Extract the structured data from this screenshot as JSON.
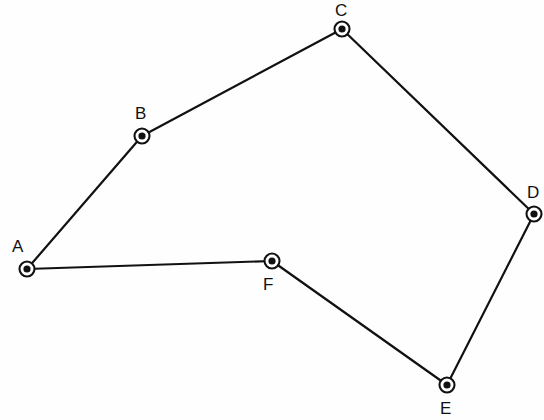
{
  "diagram": {
    "type": "node-link-polygon",
    "canvas": {
      "width": 544,
      "height": 420
    },
    "colors": {
      "background": "#fefefe",
      "stroke": "#111111",
      "node_fill": "#ffffff",
      "node_dot": "#111111",
      "label": "#111111"
    },
    "style": {
      "edge_stroke_width": 2.2,
      "node_outer_radius": 7.5,
      "node_inner_radius": 3.6,
      "node_stroke_width": 2.1,
      "label_font_size": 17
    },
    "nodes": [
      {
        "id": "A",
        "label": "A",
        "x": 27,
        "y": 269,
        "label_x": 12,
        "label_y": 238
      },
      {
        "id": "B",
        "label": "B",
        "x": 142,
        "y": 136,
        "label_x": 135,
        "label_y": 105
      },
      {
        "id": "C",
        "label": "C",
        "x": 342,
        "y": 29,
        "label_x": 335,
        "label_y": 2
      },
      {
        "id": "D",
        "label": "D",
        "x": 534,
        "y": 214,
        "label_x": 527,
        "label_y": 184
      },
      {
        "id": "E",
        "label": "E",
        "x": 447,
        "y": 385,
        "label_x": 440,
        "label_y": 400
      },
      {
        "id": "F",
        "label": "F",
        "x": 272,
        "y": 261,
        "label_x": 263,
        "label_y": 276
      }
    ],
    "edges": [
      {
        "id": "edge-a-b",
        "from": "A",
        "to": "B"
      },
      {
        "id": "edge-b-c",
        "from": "B",
        "to": "C"
      },
      {
        "id": "edge-c-d",
        "from": "C",
        "to": "D"
      },
      {
        "id": "edge-d-e",
        "from": "D",
        "to": "E"
      },
      {
        "id": "edge-e-f",
        "from": "E",
        "to": "F"
      },
      {
        "id": "edge-f-a",
        "from": "F",
        "to": "A"
      }
    ]
  }
}
